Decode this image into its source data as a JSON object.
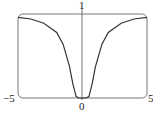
{
  "chart_data": {
    "type": "line",
    "title": "",
    "xlabel": "",
    "ylabel": "",
    "xlim": [
      -5,
      5
    ],
    "ylim": [
      0,
      1
    ],
    "grid": false,
    "legend": null,
    "tick_labels": {
      "x_left": "−5",
      "x_center": "0",
      "x_right": "5",
      "y_top": "1"
    },
    "series": [
      {
        "name": "f(x)",
        "x": [
          -5,
          -4,
          -3,
          -2,
          -1.5,
          -1,
          -0.75,
          -0.5,
          -0.3,
          0,
          0.3,
          0.5,
          0.75,
          1,
          1.5,
          2,
          3,
          4,
          5
        ],
        "y": [
          0.96,
          0.94,
          0.89,
          0.78,
          0.64,
          0.37,
          0.17,
          0.02,
          0.0,
          0.0,
          0.0,
          0.02,
          0.17,
          0.37,
          0.64,
          0.78,
          0.89,
          0.94,
          0.96
        ]
      }
    ],
    "color": "#333333"
  }
}
